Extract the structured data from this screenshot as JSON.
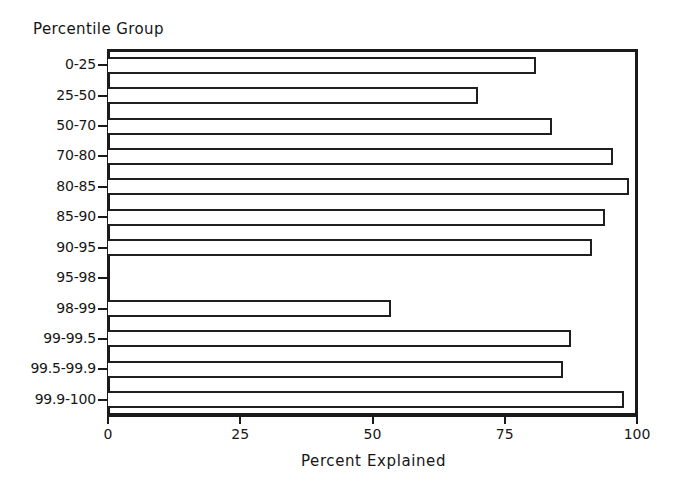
{
  "chart_data": {
    "type": "bar",
    "orientation": "horizontal",
    "title": "",
    "xlabel": "Percent Explained",
    "ylabel": "Percentile Group",
    "categories": [
      "0-25",
      "25-50",
      "50-70",
      "70-80",
      "80-85",
      "85-90",
      "90-95",
      "95-98",
      "98-99",
      "99-99.5",
      "99.5-99.9",
      "99.9-100"
    ],
    "values": [
      81,
      70,
      84,
      95.5,
      98.5,
      94,
      91.5,
      0,
      53.5,
      87.5,
      86,
      97.5
    ],
    "xlim": [
      0,
      100
    ],
    "xticks": [
      0,
      25,
      50,
      75,
      100
    ],
    "xticklabels": [
      "0",
      "25",
      "50",
      "75",
      "100"
    ],
    "grid": false,
    "legend": null,
    "bar_style": {
      "fill": "#ffffff",
      "edge": "#1f1f1f"
    }
  },
  "colors": {
    "background": "#ffffff",
    "ink": "#1a1a1a",
    "bar_fill": "#ffffff",
    "bar_edge": "#1f1f1f"
  }
}
